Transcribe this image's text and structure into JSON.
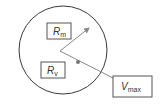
{
  "diagram": {
    "circle": {
      "cx": 63,
      "cy": 50,
      "r": 44,
      "stroke": "#3a3a3a"
    },
    "vertex": {
      "x": 60,
      "y": 51
    },
    "radius_arrow": {
      "to_x": 90,
      "to_y": 27,
      "color": "#888888"
    },
    "velocity_line": {
      "to_x": 113,
      "to_y": 78,
      "color": "#888888"
    },
    "dot": {
      "x": 78,
      "y": 63,
      "color": "#777777"
    },
    "labels": {
      "rm": {
        "main": "R",
        "sub": "m"
      },
      "rv": {
        "main": "R",
        "sub": "v"
      },
      "vmax": {
        "main": "V",
        "sub": "max"
      }
    }
  }
}
